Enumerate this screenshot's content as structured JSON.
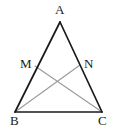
{
  "figure": {
    "type": "geometry-diagram",
    "background_color": "#ffffff",
    "canvas": {
      "width": 117,
      "height": 130
    },
    "styles": {
      "triangle_stroke_color": "#1a1a1a",
      "triangle_stroke_width": 1.6,
      "cevian_stroke_color": "#9a9a9a",
      "cevian_stroke_width": 1.1,
      "label_color": "#1a1a1a",
      "label_font_size_px": 13
    },
    "points": [
      {
        "name": "A",
        "label": "A",
        "x": 60,
        "y": 22,
        "label_x": 55,
        "label_y": 3,
        "role": "apex-vertex"
      },
      {
        "name": "B",
        "label": "B",
        "x": 15,
        "y": 112,
        "label_x": 10,
        "label_y": 114,
        "role": "base-left-vertex"
      },
      {
        "name": "C",
        "label": "C",
        "x": 102,
        "y": 112,
        "label_x": 98,
        "label_y": 114,
        "role": "base-right-vertex"
      },
      {
        "name": "M",
        "label": "M",
        "x": 35,
        "y": 66,
        "label_x": 20,
        "label_y": 57,
        "role": "point-on-side-AB"
      },
      {
        "name": "N",
        "label": "N",
        "x": 80,
        "y": 65,
        "label_x": 84,
        "label_y": 57,
        "role": "point-on-side-AC"
      }
    ],
    "segments": [
      {
        "name": "side-AB",
        "from": "A",
        "to": "B",
        "color": "#1a1a1a",
        "width": 1.6
      },
      {
        "name": "side-AC",
        "from": "A",
        "to": "C",
        "color": "#1a1a1a",
        "width": 1.6
      },
      {
        "name": "side-BC",
        "from": "B",
        "to": "C",
        "color": "#1a1a1a",
        "width": 1.6
      },
      {
        "name": "cevian-MC",
        "from": "M",
        "to": "C",
        "color": "#9a9a9a",
        "width": 1.1
      },
      {
        "name": "cevian-BN",
        "from": "B",
        "to": "N",
        "color": "#9a9a9a",
        "width": 1.1
      }
    ],
    "intersection": {
      "name": "cevian-intersection",
      "x": 58,
      "y": 85,
      "marked": false
    }
  }
}
